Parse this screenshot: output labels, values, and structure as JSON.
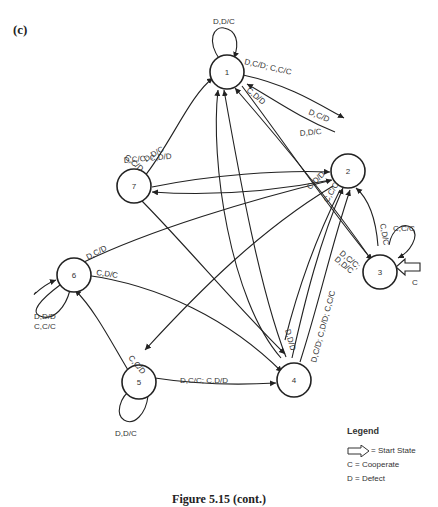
{
  "panel_label": "(c)",
  "nodes": [
    {
      "id": "1",
      "label": "1"
    },
    {
      "id": "2",
      "label": "2"
    },
    {
      "id": "3",
      "label": "3"
    },
    {
      "id": "4",
      "label": "4"
    },
    {
      "id": "5",
      "label": "5"
    },
    {
      "id": "6",
      "label": "6"
    },
    {
      "id": "7",
      "label": "7"
    }
  ],
  "start_state": {
    "node": "3",
    "label": "C"
  },
  "edges": [
    {
      "from": "1",
      "to": "1",
      "label": "D,D/C"
    },
    {
      "from": "1",
      "to": "2",
      "label": "D,C/D; C,C/C"
    },
    {
      "from": "2",
      "to": "1",
      "label": "D,C/D"
    },
    {
      "from": "1",
      "to": "3",
      "label": "C,D/D"
    },
    {
      "from": "7",
      "to": "1",
      "label": "D,D/C"
    },
    {
      "from": "7",
      "to": "2",
      "label": "D,C/C; C,D/D"
    },
    {
      "from": "2",
      "to": "7",
      "label": "D,D/C"
    },
    {
      "from": "7",
      "to": "4",
      "label": "C,C/D"
    },
    {
      "from": "2",
      "to": "5",
      "label": "C,D/D"
    },
    {
      "from": "2",
      "to": "3",
      "label": "C,C/C"
    },
    {
      "from": "3",
      "to": "2",
      "label": "C,D/C"
    },
    {
      "from": "3",
      "to": "3",
      "label": "C,C/C"
    },
    {
      "from": "3",
      "to": "1",
      "label": "D,C/C; D,D/C"
    },
    {
      "from": "4",
      "to": "2",
      "label": "D,C/D; C,D/D; C,C/C"
    },
    {
      "from": "4",
      "to": "1",
      "label": "D,D/D"
    },
    {
      "from": "6",
      "to": "2",
      "label": "D,C/D"
    },
    {
      "from": "6",
      "to": "4",
      "label": "C,D/C"
    },
    {
      "from": "6",
      "to": "6",
      "label": "D,D/D C,C/C"
    },
    {
      "from": "5",
      "to": "6",
      "label": "C,C/D"
    },
    {
      "from": "5",
      "to": "4",
      "label": "D,C/C; C,D/D"
    },
    {
      "from": "5",
      "to": "5",
      "label": "D,D/C"
    }
  ],
  "edge_labels": {
    "l11": "D,D/C",
    "l12": "D,C/D; C,C/C",
    "l21": "D,C/D",
    "l13": "C,D/D",
    "l71": "D,D/C",
    "l72": "D,C/C; C,D/D",
    "l27": "D,D/C",
    "l74": "C,C/D",
    "l25": "C,D/D",
    "l23": "C,C/C",
    "l32": "C,D/C",
    "l33": "C,C/C",
    "l31a": "D,C/C;",
    "l31b": "D,D/C",
    "l42": "D,C/D; C,D/D; C,C/C",
    "l41": "D,D/D",
    "l62": "D,C/D",
    "l64": "C,D/C",
    "l66a": "D,D/D",
    "l66b": "C,C/C",
    "l56": "C,C/D",
    "l54": "D,C/C; C,D/D",
    "l55": "D,D/C",
    "start": "C"
  },
  "legend": {
    "title": "Legend",
    "start_state": "= Start State",
    "cooperate": "C = Cooperate",
    "defect": "D = Defect"
  },
  "caption": "Figure 5.15   (cont.)"
}
